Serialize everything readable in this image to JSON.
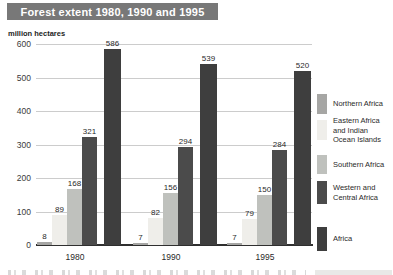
{
  "title": "Forest extent 1980, 1990 and 1995",
  "y_axis_label": "million hectares",
  "chart_data": {
    "type": "bar",
    "title": "Forest extent 1980, 1990 and 1995",
    "ylabel": "million hectares",
    "xlabel": "",
    "ylim": [
      0,
      600
    ],
    "yticks": [
      0,
      100,
      200,
      300,
      400,
      500,
      600
    ],
    "grid": true,
    "legend_position": "right",
    "categories": [
      "1980",
      "1990",
      "1995"
    ],
    "series": [
      {
        "name": "Northern Africa",
        "label_lines": [
          "Northern Africa"
        ],
        "color": "#a6a6a4",
        "values": [
          8,
          7,
          7
        ]
      },
      {
        "name": "Eastern Africa and Indian Ocean Islands",
        "label_lines": [
          "Eastern Africa",
          "and Indian",
          "Ocean Islands"
        ],
        "color": "#efeeea",
        "values": [
          89,
          82,
          79
        ]
      },
      {
        "name": "Southern Africa",
        "label_lines": [
          "Southern Africa"
        ],
        "color": "#bfc1bd",
        "values": [
          168,
          156,
          150
        ]
      },
      {
        "name": "Western and Central Africa",
        "label_lines": [
          "Western and",
          "Central Africa"
        ],
        "color": "#4b4b4b",
        "values": [
          321,
          294,
          284
        ]
      },
      {
        "name": "Africa",
        "label_lines": [
          "Africa"
        ],
        "color": "#3e3e3e",
        "values": [
          586,
          539,
          520
        ]
      }
    ]
  },
  "colors": {
    "title_banner_bg": "#787878",
    "title_text": "#ffffff",
    "gridline": "#cccccc",
    "axis_baseline": "#2f2f2f",
    "label_text": "#2a2a2a"
  }
}
